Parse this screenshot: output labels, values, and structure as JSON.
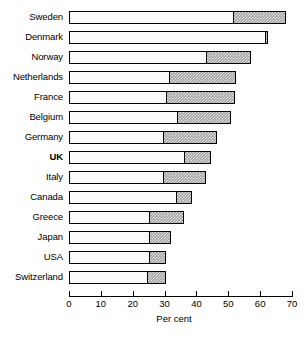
{
  "chart_data": {
    "type": "bar",
    "orientation": "horizontal",
    "stacked": true,
    "title": "",
    "subtitle": "",
    "xlabel": "Per cent",
    "ylabel": "",
    "xlim": [
      0,
      70
    ],
    "xticks": [
      0,
      10,
      20,
      30,
      40,
      50,
      60,
      70
    ],
    "grid": false,
    "legend": null,
    "categories": [
      "Sweden",
      "Denmark",
      "Norway",
      "Netherlands",
      "France",
      "Belgium",
      "Germany",
      "UK",
      "Italy",
      "Canada",
      "Greece",
      "Japan",
      "USA",
      "Switzerland"
    ],
    "highlighted_category": "UK",
    "series": [
      {
        "name": "base",
        "style": "white",
        "values": [
          51.5,
          61.5,
          43.0,
          31.5,
          30.5,
          34.0,
          29.5,
          36.0,
          29.5,
          33.5,
          25.0,
          25.0,
          25.0,
          24.5
        ]
      },
      {
        "name": "shaded",
        "style": "hatched-grey",
        "values": [
          16.5,
          1.0,
          14.0,
          21.0,
          21.5,
          17.0,
          17.0,
          8.5,
          13.5,
          5.0,
          11.0,
          7.0,
          5.5,
          6.0
        ]
      }
    ],
    "totals": [
      68.0,
      62.5,
      57.0,
      52.5,
      52.0,
      51.0,
      46.5,
      44.5,
      43.0,
      38.5,
      36.0,
      32.0,
      30.5,
      30.5
    ],
    "colors": {
      "base": "#fbfbfb",
      "shaded": "#9e9e9e",
      "outline": "#000000",
      "background": "#ffffff"
    }
  }
}
